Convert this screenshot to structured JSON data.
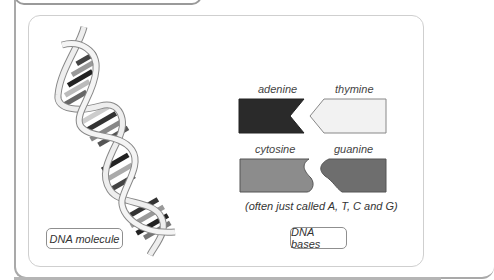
{
  "figure": {
    "left_label": "DNA molecule",
    "right_label": "DNA bases",
    "caption": "(often just called A, T, C and G)",
    "bases": [
      {
        "name": "adenine",
        "color": "#2a2a2a"
      },
      {
        "name": "thymine",
        "color": "#f2f2f2"
      },
      {
        "name": "cytosine",
        "color": "#8c8c8c"
      },
      {
        "name": "guanine",
        "color": "#6e6e6e"
      }
    ]
  }
}
